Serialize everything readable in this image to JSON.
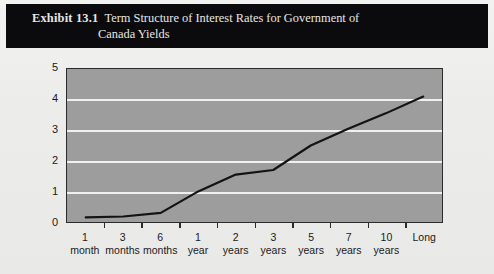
{
  "exhibit": {
    "label": "Exhibit 13.1",
    "title_line1": "Term Structure of Interest Rates for Government of",
    "title_line2": "Canada Yields"
  },
  "colors": {
    "title_bar_bg": "#0b0b0d",
    "title_text": "#e8e6e2",
    "page_bg": "#eeeeec",
    "plot_bg": "#9d9d9d",
    "plot_border": "#2b2b2b",
    "gridline": "#f0f0ee",
    "series_line": "#131313"
  },
  "chart_data": {
    "type": "line",
    "title": "Term Structure of Interest Rates for Government of Canada Yields",
    "xlabel": "",
    "ylabel": "",
    "ylim": [
      0,
      5
    ],
    "yticks": [
      0,
      1,
      2,
      3,
      4,
      5
    ],
    "ytick_labels": [
      "0",
      "1",
      "2",
      "3",
      "4",
      "5"
    ],
    "grid": true,
    "gridlines_at": [
      1,
      2,
      3,
      4
    ],
    "legend": "none",
    "categories": [
      "1 month",
      "3 months",
      "6 months",
      "1 year",
      "2 years",
      "3 years",
      "5 years",
      "7 years",
      "10 years",
      "Long"
    ],
    "category_labels": [
      {
        "l1": "1",
        "l2": "month"
      },
      {
        "l1": "3",
        "l2": "months"
      },
      {
        "l1": "6",
        "l2": "months"
      },
      {
        "l1": "1",
        "l2": "year"
      },
      {
        "l1": "2",
        "l2": "years"
      },
      {
        "l1": "3",
        "l2": "years"
      },
      {
        "l1": "5",
        "l2": "years"
      },
      {
        "l1": "7",
        "l2": "years"
      },
      {
        "l1": "10",
        "l2": "years"
      },
      {
        "l1": "Long",
        "l2": ""
      }
    ],
    "series": [
      {
        "name": "Government of Canada yield",
        "values": [
          0.15,
          0.18,
          0.3,
          1.0,
          1.55,
          1.7,
          2.5,
          3.05,
          3.55,
          4.1
        ]
      }
    ]
  }
}
